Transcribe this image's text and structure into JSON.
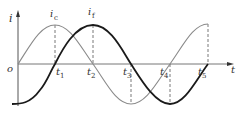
{
  "diagram": {
    "type": "waveform",
    "axes": {
      "y_label": "i",
      "x_label": "t",
      "origin_label": "o"
    },
    "curves": [
      {
        "name": "i_c",
        "label_main": "i",
        "label_sub": "c",
        "style": "thin gray",
        "color": "#8a8a8a",
        "shape": "sine"
      },
      {
        "name": "i_f",
        "label_main": "i",
        "label_sub": "f",
        "style": "thick black",
        "color": "#1a1a1a",
        "shape": "negative cosine"
      }
    ],
    "time_marks": [
      {
        "main": "t",
        "sub": "1"
      },
      {
        "main": "t",
        "sub": "2"
      },
      {
        "main": "t",
        "sub": "3"
      },
      {
        "main": "t",
        "sub": "4"
      },
      {
        "main": "t",
        "sub": "5"
      }
    ]
  }
}
